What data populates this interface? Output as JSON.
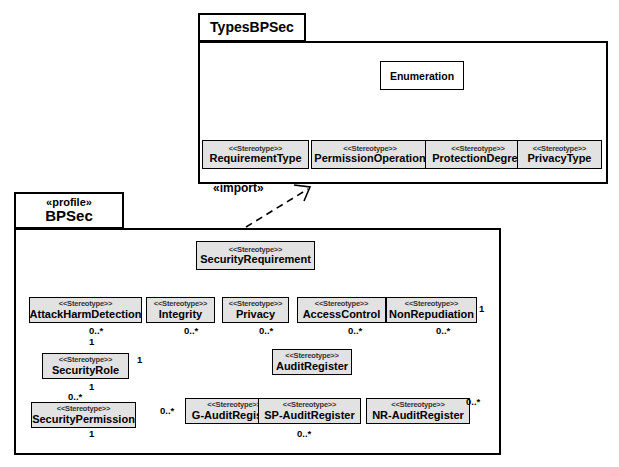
{
  "diagram": {
    "kind": "uml-profile-diagram",
    "stereotype_marker": "<<Stereotype>>"
  },
  "packages": [
    {
      "id": "types",
      "tab_stereotype": "",
      "name": "TypesBPSec"
    },
    {
      "id": "bpsec",
      "tab_stereotype": "«profile»",
      "name": "BPSec"
    }
  ],
  "types_package": {
    "root": {
      "name": "Enumeration",
      "stereotype": ""
    },
    "enums": [
      {
        "name": "RequirementType",
        "stereotype": "<<Stereotype>>"
      },
      {
        "name": "PermissionOperation",
        "stereotype": "<<Stereotype>>"
      },
      {
        "name": "ProtectionDegree",
        "stereotype": "<<Stereotype>>"
      },
      {
        "name": "PrivacyType",
        "stereotype": "<<Stereotype>>"
      }
    ]
  },
  "relations": {
    "import_label": "«import»"
  },
  "bpsec_package": {
    "root": {
      "name": "SecurityRequirement",
      "stereotype": "<<Stereotype>>"
    },
    "requirements": [
      {
        "name": "AttackHarmDetection",
        "stereotype": "<<Stereotype>>"
      },
      {
        "name": "Integrity",
        "stereotype": "<<Stereotype>>"
      },
      {
        "name": "Privacy",
        "stereotype": "<<Stereotype>>"
      },
      {
        "name": "AccessControl",
        "stereotype": "<<Stereotype>>"
      },
      {
        "name": "NonRepudiation",
        "stereotype": "<<Stereotype>>"
      }
    ],
    "roles": [
      {
        "name": "SecurityRole",
        "stereotype": "<<Stereotype>>"
      },
      {
        "name": "SecurityPermission",
        "stereotype": "<<Stereotype>>"
      }
    ],
    "audit_root": {
      "name": "AuditRegister",
      "stereotype": "<<Stereotype>>"
    },
    "audits": [
      {
        "name": "G-AuditRegister",
        "stereotype": "<<Stereotype>>"
      },
      {
        "name": "SP-AuditRegister",
        "stereotype": "<<Stereotype>>"
      },
      {
        "name": "NR-AuditRegister",
        "stereotype": "<<Stereotype>>"
      }
    ]
  },
  "multiplicities": {
    "attackharm_many": "0..*",
    "integrity_many": "0..*",
    "privacy_many": "0..*",
    "accesscontrol_many": "0..*",
    "nonrepudiation_many": "0..*",
    "nonrepudiation_one": "1",
    "securityrole_top_one": "1",
    "securityrole_right_one": "1",
    "securityrole_bottom_one": "1",
    "securitypermission_many": "0..*",
    "securitypermission_bottom_one": "1",
    "gaudit_many": "0..*",
    "spaudit_many": "0..*",
    "nraudit_many": "0..*"
  },
  "colors": {
    "stroke": "#000000",
    "stereotype_fill": "#e2e2e2",
    "plain_fill": "#ffffff",
    "background": "#ffffff"
  }
}
